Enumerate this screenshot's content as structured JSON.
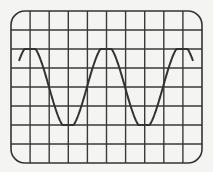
{
  "diagram": {
    "type": "oscilloscope-grid-sine-wave",
    "grid": {
      "columns": 10,
      "rows": 8,
      "left": 11,
      "top": 11,
      "right": 202,
      "bottom": 163,
      "corner_radius": 14
    },
    "wave": {
      "start_x": 19,
      "end_x": 193,
      "center_y": 87,
      "amplitude_px": 38,
      "period_px": 76,
      "peak_x": 30
    },
    "colors": {
      "background": "#f4f4f2",
      "grid": "#3a3a3a",
      "frame": "#333333",
      "wave": "#333333"
    }
  }
}
